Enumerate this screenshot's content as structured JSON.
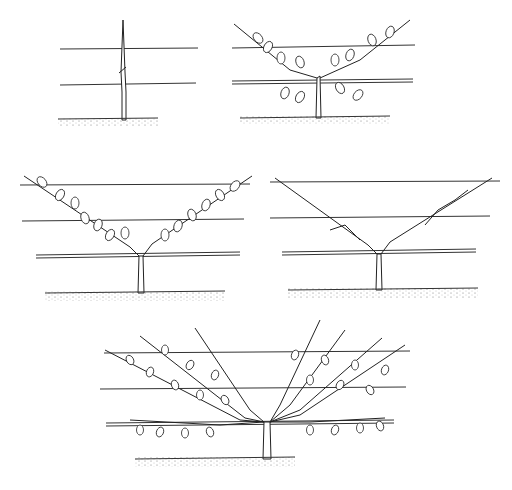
{
  "colors": {
    "ink": "#222222",
    "background": "#ffffff"
  },
  "panels": [
    {
      "id": "stage-1",
      "description": "Maiden whip cut back above the lower wire",
      "wires": 2,
      "arms": 0,
      "leaves": false
    },
    {
      "id": "stage-2",
      "description": "Two arms tied in at an angle with leafy shoots",
      "wires": 2,
      "arms": 2,
      "leaves": true
    },
    {
      "id": "stage-3",
      "description": "Arms lengthened and lowered toward the wires in leaf",
      "wires": 3,
      "arms": 2,
      "leaves": true
    },
    {
      "id": "stage-4",
      "description": "Arms pruned back in winter",
      "wires": 3,
      "arms": 2,
      "leaves": false
    },
    {
      "id": "stage-5",
      "description": "Established fan with multiple ribs",
      "wires": 3,
      "arms": 8,
      "leaves": true
    }
  ]
}
